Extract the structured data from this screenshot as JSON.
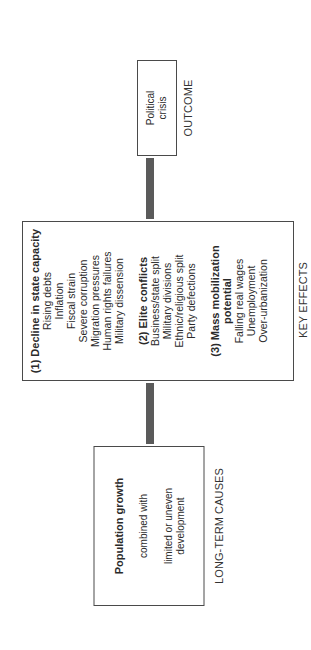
{
  "diagram": {
    "orientation": "rotated -90deg (text reads bottom-to-top)",
    "colors": {
      "box_border": "#4a4a4a",
      "connector": "#5a5a5a",
      "text": "#2a2a2a",
      "background": "#ffffff"
    },
    "outcome": {
      "label": "OUTCOME",
      "box_lines": [
        "Political",
        "crisis"
      ]
    },
    "key_effects": {
      "label": "KEY EFFECTS",
      "sections": [
        {
          "heading": "(1) Decline in state capacity",
          "items": [
            "Rising debts",
            "Inflation",
            "Fiscal strain",
            "Severe corruption",
            "Migration pressures",
            "Human rights failures",
            "Military dissension"
          ]
        },
        {
          "heading": "(2) Elite conflicts",
          "items": [
            "Business/state split",
            "Military divisions",
            "Ethnic/religious split",
            "Party defections"
          ]
        },
        {
          "heading": "(3) Mass mobilization potential",
          "items": [
            "Falling real wages",
            "Unemployment",
            "Over-urbanization"
          ]
        }
      ]
    },
    "long_term_causes": {
      "label": "LONG-TERM CAUSES",
      "heading": "Population growth",
      "connector_text": "combined with",
      "tail_lines": [
        "limited or uneven",
        "development"
      ]
    },
    "flow": [
      "LONG-TERM CAUSES",
      "KEY EFFECTS",
      "OUTCOME"
    ]
  }
}
